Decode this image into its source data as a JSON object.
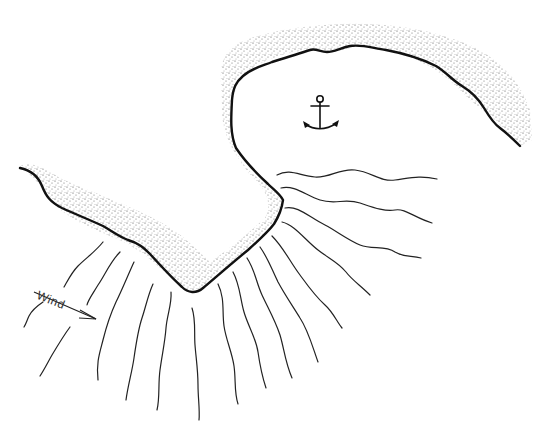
{
  "diagram": {
    "type": "coastline-harbor-sketch",
    "labels": {
      "wind": "Wind"
    },
    "elements": {
      "anchor": "anchor-icon",
      "wind_arrow": "arrow-right-down",
      "coastline": "sandy-shore",
      "waves": "wave-refraction-lines"
    },
    "colors": {
      "ink": "#111111",
      "background": "#ffffff",
      "sand": "#555555"
    }
  }
}
